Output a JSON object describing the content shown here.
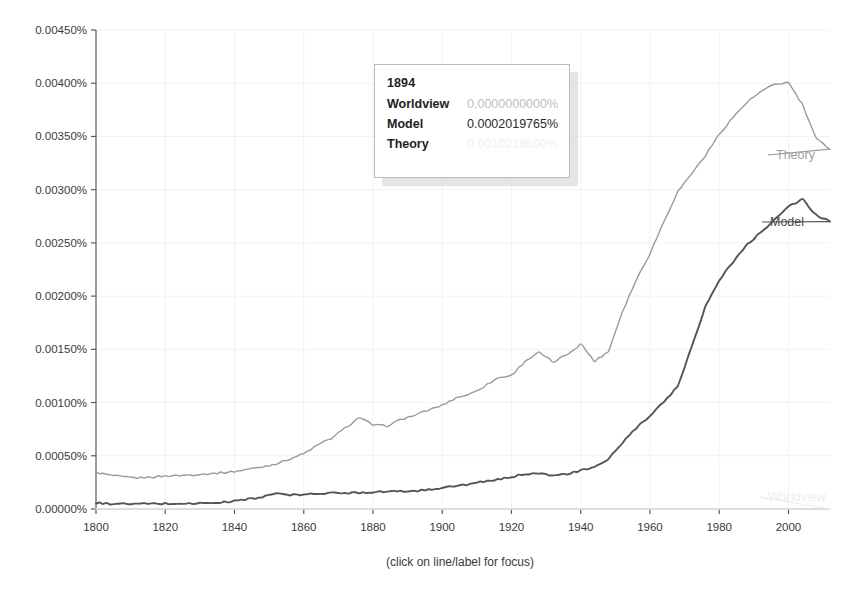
{
  "chart_data": {
    "type": "line",
    "title": "",
    "xlabel": "",
    "ylabel": "",
    "caption": "(click on line/label for focus)",
    "grid": true,
    "legend_position": "right-inline-labels",
    "xlim": [
      1800,
      2012
    ],
    "ylim": [
      0,
      0.0045
    ],
    "x_tick_labels": [
      "1800",
      "1820",
      "1840",
      "1860",
      "1880",
      "1900",
      "1920",
      "1940",
      "1960",
      "1980",
      "2000"
    ],
    "x_ticks": [
      1800,
      1820,
      1840,
      1860,
      1880,
      1900,
      1920,
      1940,
      1960,
      1980,
      2000
    ],
    "y_tick_labels": [
      "0.00450%",
      "0.00400%",
      "0.00350%",
      "0.00300%",
      "0.00250%",
      "0.00200%",
      "0.00150%",
      "0.00100%",
      "0.00050%",
      "0.00000%"
    ],
    "y_ticks": [
      0.0045,
      0.004,
      0.0035,
      0.003,
      0.0025,
      0.002,
      0.0015,
      0.001,
      0.0005,
      0
    ],
    "y_unit": "%",
    "series": [
      {
        "name": "Theory",
        "color": "#9a9a9a",
        "label_color": "#a0a0a0",
        "x": [
          1800,
          1804,
          1808,
          1812,
          1816,
          1820,
          1824,
          1828,
          1832,
          1836,
          1840,
          1844,
          1848,
          1852,
          1856,
          1860,
          1864,
          1868,
          1872,
          1876,
          1880,
          1884,
          1888,
          1892,
          1896,
          1900,
          1904,
          1908,
          1912,
          1916,
          1920,
          1924,
          1928,
          1932,
          1936,
          1940,
          1944,
          1948,
          1952,
          1956,
          1960,
          1964,
          1968,
          1972,
          1976,
          1980,
          1984,
          1988,
          1992,
          1996,
          2000,
          2004,
          2008,
          2012
        ],
        "values": [
          0.000345,
          0.000318,
          0.0003,
          0.000292,
          0.0003,
          0.00031,
          0.000315,
          0.000322,
          0.00033,
          0.00034,
          0.000352,
          0.000375,
          0.000395,
          0.000425,
          0.00047,
          0.00052,
          0.0006,
          0.000665,
          0.00076,
          0.00086,
          0.00079,
          0.00078,
          0.00084,
          0.00088,
          0.00093,
          0.000975,
          0.001045,
          0.00108,
          0.00115,
          0.00123,
          0.001255,
          0.00139,
          0.00147,
          0.00138,
          0.00145,
          0.00155,
          0.00139,
          0.00148,
          0.00185,
          0.00215,
          0.0024,
          0.0027,
          0.00298,
          0.00315,
          0.00332,
          0.00352,
          0.00368,
          0.00382,
          0.00392,
          0.00399,
          0.004005,
          0.0038,
          0.00348,
          0.00338
        ]
      },
      {
        "name": "Model",
        "color": "#555555",
        "label_color": "#4a4a4a",
        "x": [
          1800,
          1804,
          1808,
          1812,
          1816,
          1820,
          1824,
          1828,
          1832,
          1836,
          1840,
          1844,
          1848,
          1852,
          1856,
          1860,
          1864,
          1868,
          1872,
          1876,
          1880,
          1884,
          1888,
          1892,
          1896,
          1900,
          1904,
          1908,
          1912,
          1916,
          1920,
          1924,
          1928,
          1932,
          1936,
          1940,
          1944,
          1948,
          1952,
          1956,
          1960,
          1964,
          1968,
          1972,
          1976,
          1980,
          1984,
          1988,
          1992,
          1996,
          2000,
          2004,
          2008,
          2012
        ],
        "values": [
          5.5e-05,
          5e-05,
          4.8e-05,
          4.8e-05,
          5e-05,
          5e-05,
          5e-05,
          5.2e-05,
          5.5e-05,
          6e-05,
          7.5e-05,
          9.5e-05,
          0.00011,
          0.00015,
          0.00013,
          0.000135,
          0.000145,
          0.00015,
          0.00015,
          0.000155,
          0.00016,
          0.000165,
          0.000165,
          0.00017,
          0.00018,
          0.000202,
          0.000215,
          0.000235,
          0.000255,
          0.000275,
          0.0003,
          0.00033,
          0.00034,
          0.00031,
          0.00033,
          0.00036,
          0.00039,
          0.00047,
          0.00062,
          0.00076,
          0.00087,
          0.00101,
          0.00115,
          0.00152,
          0.0019,
          0.00215,
          0.00232,
          0.00248,
          0.0026,
          0.00272,
          0.00284,
          0.00291,
          0.00276,
          0.0027
        ]
      },
      {
        "name": "Worldview",
        "color": "#ededed",
        "label_color": "#ededed",
        "x": [
          1800,
          1850,
          1900,
          1950,
          2000,
          2012
        ],
        "values": [
          0.0,
          0.0,
          0.0,
          0.0,
          0.0,
          0.0
        ]
      }
    ]
  },
  "tooltip": {
    "year": "1894",
    "rows": [
      {
        "name": "Worldview",
        "value": "0.0000000000%"
      },
      {
        "name": "Model",
        "value": "0.0002019765%"
      },
      {
        "name": "Theory",
        "value": "0.0010218590%"
      }
    ]
  },
  "series_labels": {
    "theory": "Theory",
    "model": "Model",
    "worldview": "Worldview"
  },
  "caption": "(click on line/label for focus)"
}
